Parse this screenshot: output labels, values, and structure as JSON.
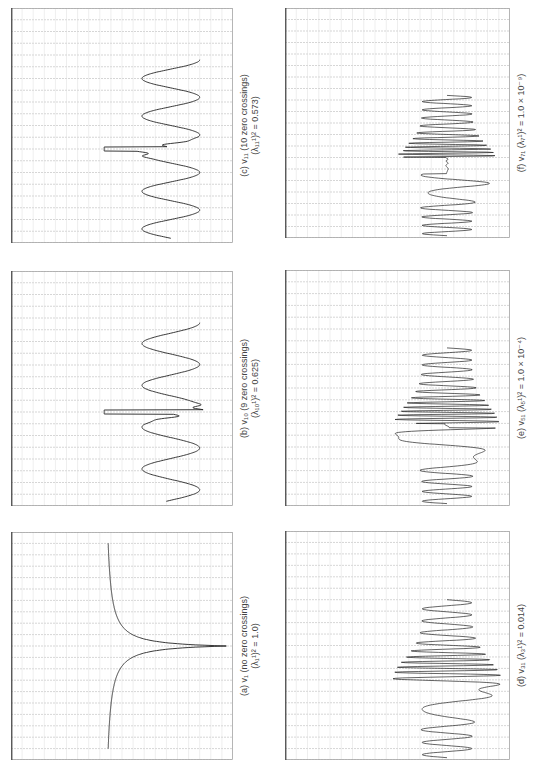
{
  "figure": {
    "orientation": "rotated 90deg counter-clockwise",
    "grid": {
      "h_lines": 20,
      "v_lines": 20,
      "line_color": "#bbbbbb",
      "axis_color": "#444444"
    },
    "panels": [
      {
        "id": "a",
        "caption_line1": "(a)  v₁  (no zero crossings)",
        "caption_line2": "(λ₁¹)² = 1.0)",
        "box": {
          "x": 11,
          "y": 532,
          "w": 222,
          "h": 228
        },
        "curve": "single_peak"
      },
      {
        "id": "b",
        "caption_line1": "(b)  v₁₀  (9 zero crossings)",
        "caption_line2": "(λ₁₀¹)² = 0.625)",
        "box": {
          "x": 11,
          "y": 271,
          "w": 222,
          "h": 235
        },
        "curve": "osc_9"
      },
      {
        "id": "c",
        "caption_line1": "(c)  v₁₁  (10 zero crossings)",
        "caption_line2": "(λ₁₁¹)² = 0.573)",
        "box": {
          "x": 11,
          "y": 8,
          "w": 222,
          "h": 235
        },
        "curve": "osc_10"
      },
      {
        "id": "d",
        "caption_line1": "(d)  v₃₁  (λ₃¹)² = 0.014)",
        "caption_line2": "",
        "box": {
          "x": 285,
          "y": 531,
          "w": 225,
          "h": 229
        },
        "curve": "dense_31"
      },
      {
        "id": "e",
        "caption_line1": "(e)  v₅₁  (λ₅¹)² = 1.0 × 10⁻⁴)",
        "caption_line2": "",
        "box": {
          "x": 285,
          "y": 270,
          "w": 225,
          "h": 236
        },
        "curve": "dense_51"
      },
      {
        "id": "f",
        "caption_line1": "(f)  v₇₁  (λ₇¹)² = 1.0 × 10⁻⁹)",
        "caption_line2": "",
        "box": {
          "x": 285,
          "y": 8,
          "w": 225,
          "h": 230
        },
        "curve": "dense_71"
      }
    ]
  },
  "chart_data": [
    {
      "type": "line",
      "title": "(a) v1 (no zero crossings) (λ1)^2 = 1.0",
      "description": "single sharp peak at centre, decaying tails",
      "zero_crossings": 0,
      "eigenvalue_sq": 1.0
    },
    {
      "type": "line",
      "title": "(b) v10 (9 zero crossings) (λ10)^2 = 0.625",
      "description": "oscillatory curve with sharp central spike",
      "zero_crossings": 9,
      "eigenvalue_sq": 0.625
    },
    {
      "type": "line",
      "title": "(c) v11 (10 zero crossings) (λ11)^2 = 0.573",
      "description": "oscillatory curve with sharp central double spike",
      "zero_crossings": 10,
      "eigenvalue_sq": 0.573
    },
    {
      "type": "line",
      "title": "(d) v31 (λ31)^2 = 0.014",
      "description": "dense oscillation, amplitude growing toward centre",
      "eigenvalue_sq": 0.014
    },
    {
      "type": "line",
      "title": "(e) v51 (λ51)^2 = 1.0e-4",
      "description": "dense oscillation, node at centre",
      "eigenvalue_sq": 0.0001
    },
    {
      "type": "line",
      "title": "(f) v71 (λ71)^2 = 1.0e-9",
      "description": "very dense oscillation, flat node region at centre",
      "eigenvalue_sq": 1e-09
    }
  ]
}
